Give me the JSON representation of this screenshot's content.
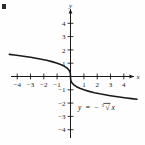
{
  "figure": {
    "corner_mark": "figure-corner-tick"
  },
  "chart_data": {
    "type": "line",
    "title": "",
    "subtitle": "",
    "xlabel": "x",
    "ylabel": "y",
    "equation_label": "y = -∛ x",
    "equation_parts": {
      "lhs": "y",
      "operator": "=",
      "sign": "−",
      "radical_index": "3",
      "radicand": "x"
    },
    "xlim": [
      -5.0,
      5.2
    ],
    "ylim": [
      -4.8,
      5.0
    ],
    "xticks": [
      -4,
      -3,
      -2,
      -1,
      1,
      2,
      3,
      4
    ],
    "yticks": [
      -4,
      -3,
      -2,
      -1,
      1,
      2,
      3,
      4
    ],
    "xtick_labels": [
      "−4",
      "−3",
      "−2",
      "−1",
      "1",
      "2",
      "3",
      "4"
    ],
    "ytick_labels": [
      "−4",
      "−3",
      "−2",
      "−1",
      "1",
      "2",
      "3",
      "4"
    ],
    "grid": false,
    "legend": "none",
    "axis_arrows": [
      "x-positive",
      "y-positive"
    ],
    "series": [
      {
        "name": "y = -cbrt(x)",
        "color": "#1a1a1a",
        "linewidth": 1.6,
        "x": [
          -4.6,
          -4.2,
          -3.8,
          -3.4,
          -3.0,
          -2.6,
          -2.2,
          -1.8,
          -1.4,
          -1.0,
          -0.7,
          -0.45,
          -0.25,
          -0.12,
          -0.05,
          -0.015,
          0,
          0.015,
          0.05,
          0.12,
          0.25,
          0.45,
          0.7,
          1.0,
          1.4,
          1.8,
          2.2,
          2.6,
          3.0,
          3.4,
          3.8,
          4.2,
          4.6,
          5.0
        ],
        "y": [
          1.663,
          1.613,
          1.56,
          1.504,
          1.442,
          1.375,
          1.301,
          1.216,
          1.119,
          1.0,
          0.888,
          0.766,
          0.63,
          0.493,
          0.368,
          0.247,
          0,
          -0.247,
          -0.368,
          -0.493,
          -0.63,
          -0.766,
          -0.888,
          -1.0,
          -1.119,
          -1.216,
          -1.301,
          -1.375,
          -1.442,
          -1.504,
          -1.56,
          -1.613,
          -1.663,
          -1.71
        ]
      }
    ]
  }
}
